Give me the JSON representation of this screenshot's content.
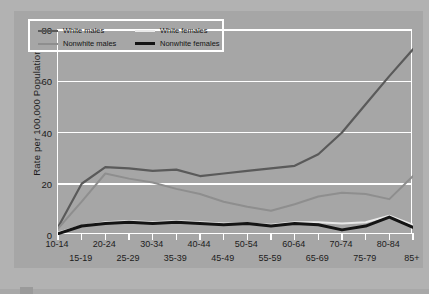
{
  "chart_data": {
    "type": "line",
    "title": "",
    "xlabel": "",
    "ylabel": "Rate per 100,000 Population",
    "categories": [
      "10-14",
      "15-19",
      "20-24",
      "25-29",
      "30-34",
      "35-39",
      "40-44",
      "45-49",
      "50-54",
      "55-59",
      "60-64",
      "65-69",
      "70-74",
      "75-79",
      "80-84",
      "85+"
    ],
    "ylim": [
      0,
      80
    ],
    "yticks": [
      0,
      20,
      40,
      60,
      80
    ],
    "grid": true,
    "legend_position": "upper-left",
    "series": [
      {
        "name": "White males",
        "color": "#5a5a5a",
        "values": [
          3,
          20,
          26.5,
          26,
          25,
          25.5,
          23,
          24,
          25,
          26,
          27,
          31.5,
          40,
          51,
          62,
          72.5
        ]
      },
      {
        "name": "Nonwhite males",
        "color": "#8e8e8e",
        "values": [
          2.5,
          13,
          24,
          22,
          20.5,
          18,
          16,
          13,
          11,
          9.5,
          12,
          15,
          16.5,
          16,
          14,
          23
        ]
      },
      {
        "name": "White females",
        "color": "#e8e8e8",
        "values": [
          1,
          3.5,
          5,
          5.5,
          5,
          5.5,
          5,
          4.5,
          4.5,
          4,
          5,
          5,
          4.5,
          5,
          7.5,
          4
        ]
      },
      {
        "name": "Nonwhite females",
        "color": "#141414",
        "values": [
          0.5,
          3.5,
          4.5,
          5,
          4.5,
          5,
          4.5,
          4,
          4.5,
          3.5,
          4.5,
          4,
          2,
          3.5,
          7,
          3
        ]
      }
    ]
  },
  "legend": {
    "entries": [
      {
        "label": "White males",
        "color": "#5a5a5a"
      },
      {
        "label": "White females",
        "color": "#eaeaea"
      },
      {
        "label": "Nonwhite males",
        "color": "#8e8e8e"
      },
      {
        "label": "Nonwhite females",
        "color": "#141414"
      }
    ]
  }
}
